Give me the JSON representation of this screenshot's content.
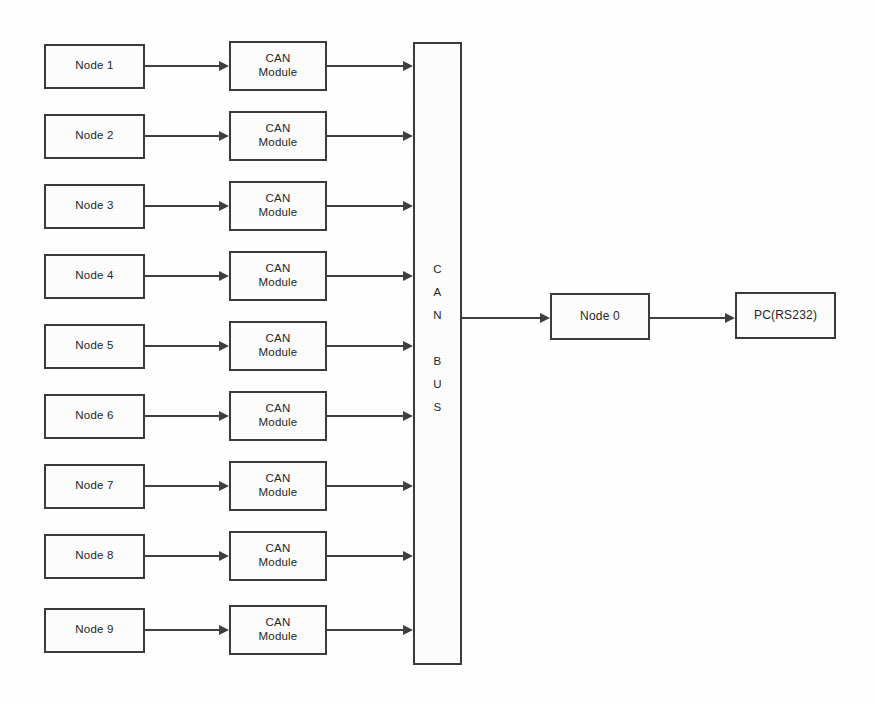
{
  "diagram": {
    "background_color": "#ffffff",
    "stroke_color": "#3b3b3b",
    "box_fill_color": "#fdfdfd",
    "text_color": "#262626",
    "bus": {
      "label": "C\nA\nN\n\nB\nU\nS",
      "letters": [
        "C",
        "A",
        "N",
        "",
        "B",
        "U",
        "S"
      ],
      "orientation": "vertical"
    },
    "rows": [
      {
        "node_label": "Node 1",
        "module_label": "CAN\nModule"
      },
      {
        "node_label": "Node 2",
        "module_label": "CAN\nModule"
      },
      {
        "node_label": "Node 3",
        "module_label": "CAN\nModule"
      },
      {
        "node_label": "Node 4",
        "module_label": "CAN\nModule"
      },
      {
        "node_label": "Node 5",
        "module_label": "CAN\nModule"
      },
      {
        "node_label": "Node 6",
        "module_label": "CAN\nModule"
      },
      {
        "node_label": "Node 7",
        "module_label": "CAN\nModule"
      },
      {
        "node_label": "Node 8",
        "module_label": "CAN\nModule"
      },
      {
        "node_label": "Node 9",
        "module_label": "CAN\nModule"
      }
    ],
    "endpoints": {
      "node0_label": "Node 0",
      "pc_label": "PC(RS232)"
    }
  }
}
